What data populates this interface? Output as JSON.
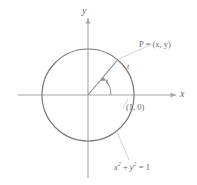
{
  "figure": {
    "background_color": "#ffffff",
    "axis_color": "#a8a8ad",
    "circle_color": "#77777d",
    "radius_color": "#8a8a90",
    "leader_color": "#c2c2c8",
    "text_color": "#6a6a70"
  },
  "axes": {
    "x_label": "x",
    "y_label": "y",
    "origin": {
      "x": 88,
      "y": 95
    },
    "x_range": [
      18,
      178
    ],
    "y_range": [
      12,
      178
    ]
  },
  "circle": {
    "center": {
      "x": 88,
      "y": 95
    },
    "radius": 46,
    "equation_label": "x² + y² = 1",
    "equation_parts": {
      "x_base": "x",
      "y_base": "y",
      "exponent": "2",
      "rhs": "= 1"
    }
  },
  "points": {
    "P": {
      "label": "P = (x, y)",
      "coords": {
        "x": 118,
        "y": 60
      }
    },
    "unit_point": {
      "label": "(1, 0)",
      "coords": {
        "x": 134,
        "y": 95
      }
    }
  },
  "angle": {
    "label": "t",
    "arc_label": "t",
    "degrees": 50
  }
}
